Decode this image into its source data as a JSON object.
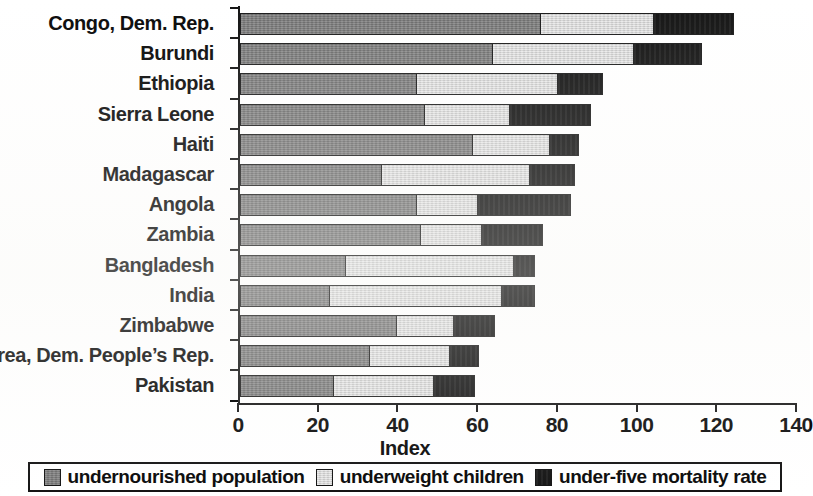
{
  "chart_data": {
    "type": "bar",
    "orientation": "horizontal",
    "stacked": true,
    "title": "",
    "xlabel": "Index",
    "ylabel": "",
    "xlim": [
      0,
      140
    ],
    "xticks": [
      0,
      20,
      40,
      60,
      80,
      100,
      120,
      140
    ],
    "grid": false,
    "legend_position": "bottom",
    "categories": [
      "Congo, Dem. Rep.",
      "Burundi",
      "Ethiopia",
      "Sierra Leone",
      "Haiti",
      "Madagascar",
      "Angola",
      "Zambia",
      "Bangladesh",
      "India",
      "Zimbabwe",
      "Korea, Dem. People’s Rep.",
      "Pakistan"
    ],
    "series": [
      {
        "name": "undernourished population",
        "color": "#7c7c7c",
        "values": [
          75,
          63,
          44,
          46,
          58,
          35,
          44,
          45,
          26,
          22,
          39,
          32,
          23
        ]
      },
      {
        "name": "underweight children",
        "color": "#d9d9d9",
        "values": [
          28,
          35,
          35,
          21,
          19,
          37,
          15,
          15,
          42,
          43,
          14,
          20,
          25
        ]
      },
      {
        "name": "under-five mortality rate",
        "color": "#151515",
        "values": [
          20,
          17,
          11,
          20,
          7,
          11,
          23,
          15,
          5,
          8,
          10,
          7,
          10
        ]
      }
    ],
    "totals": [
      123,
      115,
      90,
      87,
      84,
      83,
      82,
      75,
      73,
      73,
      63,
      59,
      58
    ],
    "cumulative_boundaries": [
      [
        75,
        103,
        123
      ],
      [
        63,
        98,
        115
      ],
      [
        44,
        79,
        90
      ],
      [
        46,
        67,
        87
      ],
      [
        58,
        77,
        84
      ],
      [
        35,
        72,
        83
      ],
      [
        44,
        59,
        82
      ],
      [
        45,
        60,
        75
      ],
      [
        26,
        68,
        73
      ],
      [
        22,
        65,
        73
      ],
      [
        39,
        53,
        63
      ],
      [
        32,
        52,
        59
      ],
      [
        23,
        48,
        58
      ]
    ]
  },
  "legend": {
    "items": [
      {
        "label": "undernourished population",
        "color": "#7c7c7c"
      },
      {
        "label": "underweight children",
        "color": "#d9d9d9"
      },
      {
        "label": "under-five mortality rate",
        "color": "#151515"
      }
    ]
  }
}
